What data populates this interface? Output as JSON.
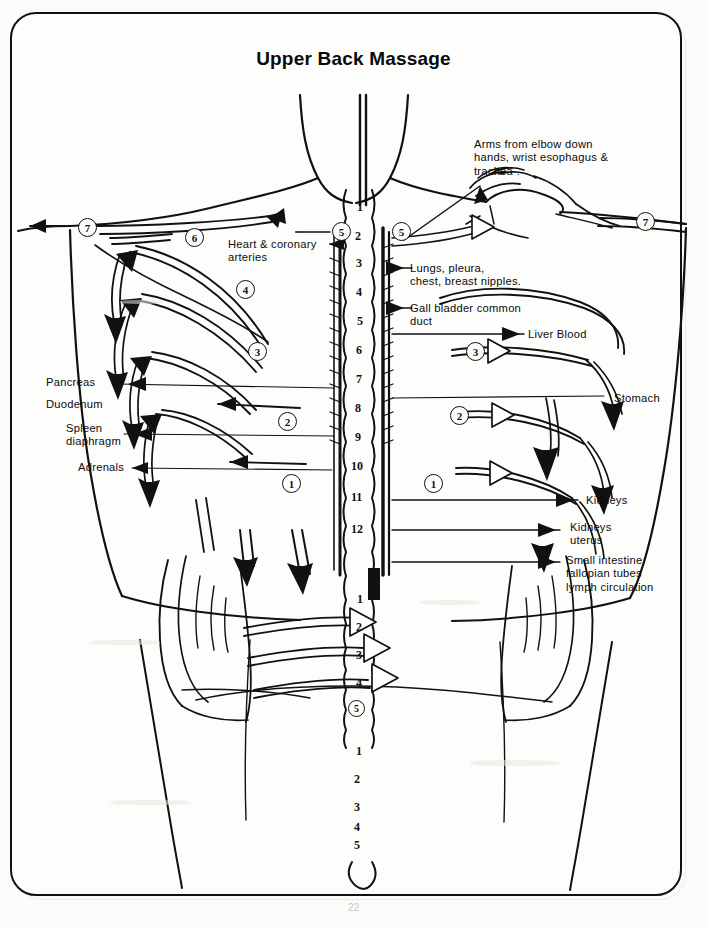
{
  "document": {
    "title": "Upper Back Massage",
    "page_number": "22",
    "type": "anatomical-reflexology-diagram"
  },
  "labels": {
    "arms": "Arms from elbow down\nhands, wrist esophagus &\ntrachea .",
    "heart": "Heart & coronary\narteries",
    "lungs": "Lungs, pleura,\nchest, breast nipples.",
    "gall_bladder": "Gall bladder common\nduct",
    "liver": "Liver  Blood",
    "pancreas": "Pancreas",
    "duodenum": "Duodenum",
    "spleen": "Spleen\ndiaphragm",
    "adrenals": "Adrenals",
    "stomach": "Stomach",
    "kidneys": "Kidneys",
    "kidneys_uterus": "Kidneys\nuterus",
    "small_intestine": "Small intestine\nfallopian tubes\nlymph circulation"
  },
  "spine": {
    "thoracic": [
      "1",
      "2",
      "3",
      "4",
      "5",
      "6",
      "7",
      "8",
      "9",
      "10",
      "11",
      "12"
    ],
    "lumbar": [
      "1",
      "2",
      "3",
      "4",
      "5"
    ],
    "sacral": [
      "1",
      "2",
      "3",
      "4",
      "5"
    ]
  },
  "step_markers": {
    "left": [
      "7",
      "6",
      "5",
      "4",
      "3",
      "2",
      "1"
    ],
    "right": [
      "7",
      "5",
      "3",
      "2",
      "1"
    ],
    "lumbar_circled": "5"
  },
  "colors": {
    "ink": "#111111",
    "paper": "#fdfdfb",
    "border": "#111111"
  }
}
